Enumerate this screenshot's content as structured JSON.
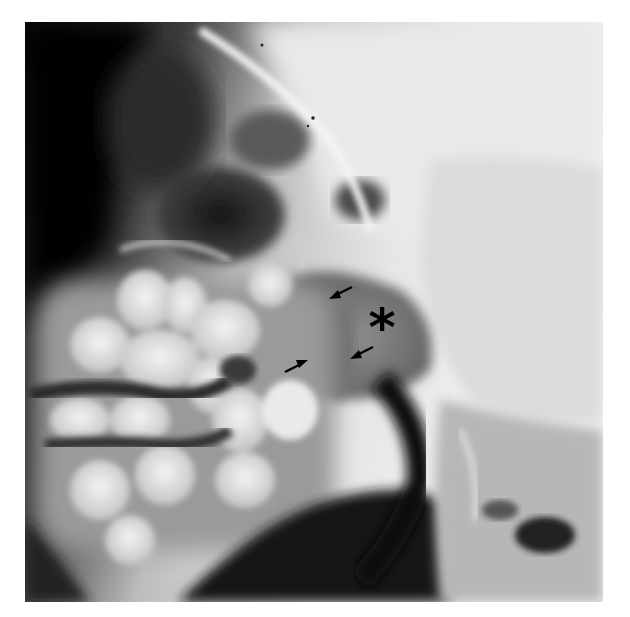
{
  "image": {
    "type": "lateral skull radiograph (grayscale)",
    "annotations": {
      "asterisk": {
        "symbol": "*",
        "x": 382,
        "y": 322
      },
      "arrows": [
        {
          "id": "arrow-upper",
          "from": [
            352,
            287
          ],
          "to": [
            331,
            298
          ]
        },
        {
          "id": "arrow-lower-left",
          "from": [
            285,
            372
          ],
          "to": [
            306,
            361
          ]
        },
        {
          "id": "arrow-lower-right",
          "from": [
            373,
            347
          ],
          "to": [
            352,
            357
          ]
        }
      ]
    },
    "colors": {
      "background": "#ffffff",
      "bone": "#e8e8e8",
      "air": "#111111",
      "soft_tissue": "#7a7a7a",
      "annotation": "#000000"
    }
  }
}
